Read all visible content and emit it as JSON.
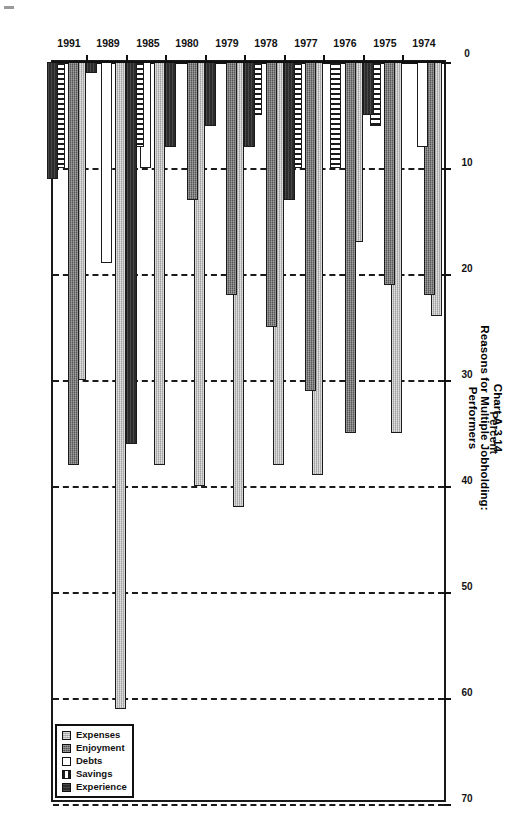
{
  "title": {
    "line1": "Chart A-3.14",
    "line2": "Reasons for Multiple Jobholding:",
    "line3": "Performers"
  },
  "axis": {
    "x_title": "Percent",
    "ticks": [
      "0",
      "10",
      "20",
      "30",
      "40",
      "50",
      "60",
      "70"
    ],
    "min": 0,
    "max": 70,
    "step": 10
  },
  "legend": {
    "items": [
      {
        "label": "Expenses",
        "key": "expenses"
      },
      {
        "label": "Enjoyment",
        "key": "enjoyment"
      },
      {
        "label": "Debts",
        "key": "debts"
      },
      {
        "label": "Savings",
        "key": "savings"
      },
      {
        "label": "Experience",
        "key": "experience"
      }
    ]
  },
  "chart_data": {
    "type": "bar",
    "orientation": "horizontal",
    "title": "Chart A-3.14 Reasons for Multiple Jobholding: Performers",
    "xlabel": "Percent",
    "ylabel": "",
    "xlim": [
      0,
      70
    ],
    "grid": true,
    "legend_position": "bottom-right",
    "categories": [
      "1974",
      "1975",
      "1976",
      "1977",
      "1978",
      "1979",
      "1980",
      "1985",
      "1989",
      "1991"
    ],
    "series": [
      {
        "name": "Expenses",
        "values": [
          24,
          35,
          17,
          39,
          38,
          42,
          40,
          38,
          61,
          30
        ]
      },
      {
        "name": "Enjoyment",
        "values": [
          22,
          21,
          35,
          31,
          25,
          22,
          13,
          0,
          0,
          38
        ]
      },
      {
        "name": "Debts",
        "values": [
          8,
          0,
          0,
          0,
          0,
          0,
          0,
          10,
          19,
          0
        ]
      },
      {
        "name": "Savings",
        "values": [
          0,
          6,
          10,
          10,
          5,
          0,
          0,
          8,
          0,
          10
        ]
      },
      {
        "name": "Experience",
        "values": [
          0,
          5,
          0,
          13,
          8,
          6,
          8,
          36,
          1,
          11
        ]
      }
    ]
  }
}
